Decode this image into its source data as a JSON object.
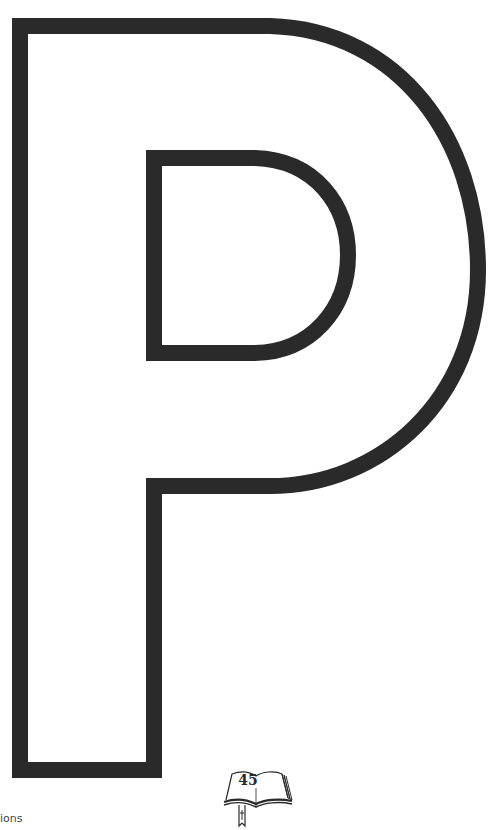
{
  "page": {
    "letter": "P",
    "letter_style": "outline",
    "stroke_color": "#2a2a2a",
    "background_color": "#ffffff"
  },
  "footer": {
    "page_number": "45",
    "page_icon": "open-book-with-bookmark-icon",
    "cut_off_text": "ions"
  }
}
